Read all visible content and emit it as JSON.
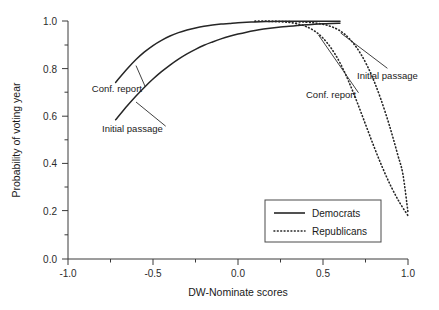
{
  "chart_data": {
    "type": "line",
    "title": "",
    "xlabel": "DW-Nominate scores",
    "ylabel": "Probability of voting year",
    "xlim": [
      -1.0,
      1.0
    ],
    "ylim": [
      0.0,
      1.0
    ],
    "grid": false,
    "xticks": [
      "-1.0",
      "-0.5",
      "0.0",
      "0.5",
      "1.0"
    ],
    "xtick_values": [
      -1.0,
      -0.5,
      0.0,
      0.5,
      1.0
    ],
    "xminor_values": [
      -0.75,
      -0.25,
      0.25,
      0.75
    ],
    "yticks": [
      "0.0",
      "0.2",
      "0.4",
      "0.6",
      "0.8",
      "1.0"
    ],
    "ytick_values": [
      0.0,
      0.2,
      0.4,
      0.6,
      0.8,
      1.0
    ],
    "yminor_values": [
      0.1,
      0.3,
      0.5,
      0.7,
      0.9
    ],
    "legend_position": "lower-right",
    "legend": [
      {
        "name": "Democrats",
        "style": "solid"
      },
      {
        "name": "Republicans",
        "style": "dotted"
      }
    ],
    "series": [
      {
        "name": "Democrats - Conf. report",
        "party": "Democrats",
        "style": "solid",
        "points": [
          [
            -0.72,
            0.742
          ],
          [
            -0.65,
            0.8
          ],
          [
            -0.6,
            0.838
          ],
          [
            -0.55,
            0.87
          ],
          [
            -0.5,
            0.897
          ],
          [
            -0.45,
            0.919
          ],
          [
            -0.4,
            0.937
          ],
          [
            -0.35,
            0.951
          ],
          [
            -0.3,
            0.962
          ],
          [
            -0.25,
            0.971
          ],
          [
            -0.2,
            0.978
          ],
          [
            -0.15,
            0.983
          ],
          [
            -0.1,
            0.987
          ],
          [
            -0.05,
            0.99
          ],
          [
            0.0,
            0.993
          ],
          [
            0.05,
            0.995
          ],
          [
            0.1,
            0.996
          ],
          [
            0.2,
            0.998
          ],
          [
            0.3,
            0.999
          ],
          [
            0.4,
            0.999
          ],
          [
            0.5,
            0.999
          ],
          [
            0.6,
            0.999
          ]
        ]
      },
      {
        "name": "Democrats - Initial passage",
        "party": "Democrats",
        "style": "solid",
        "points": [
          [
            -0.72,
            0.585
          ],
          [
            -0.65,
            0.645
          ],
          [
            -0.6,
            0.685
          ],
          [
            -0.55,
            0.722
          ],
          [
            -0.5,
            0.756
          ],
          [
            -0.45,
            0.787
          ],
          [
            -0.4,
            0.815
          ],
          [
            -0.35,
            0.84
          ],
          [
            -0.3,
            0.862
          ],
          [
            -0.25,
            0.881
          ],
          [
            -0.2,
            0.898
          ],
          [
            -0.15,
            0.912
          ],
          [
            -0.1,
            0.925
          ],
          [
            -0.05,
            0.936
          ],
          [
            0.0,
            0.945
          ],
          [
            0.05,
            0.953
          ],
          [
            0.1,
            0.96
          ],
          [
            0.15,
            0.966
          ],
          [
            0.2,
            0.971
          ],
          [
            0.25,
            0.975
          ],
          [
            0.3,
            0.978
          ],
          [
            0.35,
            0.981
          ],
          [
            0.4,
            0.984
          ],
          [
            0.45,
            0.986
          ],
          [
            0.5,
            0.988
          ],
          [
            0.55,
            0.99
          ],
          [
            0.6,
            0.991
          ]
        ]
      },
      {
        "name": "Republicans - Conf. report",
        "party": "Republicans",
        "style": "dotted",
        "points": [
          [
            0.1,
            0.999
          ],
          [
            0.15,
            0.999
          ],
          [
            0.2,
            0.998
          ],
          [
            0.25,
            0.997
          ],
          [
            0.3,
            0.994
          ],
          [
            0.35,
            0.988
          ],
          [
            0.4,
            0.977
          ],
          [
            0.45,
            0.958
          ],
          [
            0.5,
            0.928
          ],
          [
            0.55,
            0.884
          ],
          [
            0.6,
            0.824
          ],
          [
            0.65,
            0.748
          ],
          [
            0.7,
            0.66
          ],
          [
            0.75,
            0.566
          ],
          [
            0.8,
            0.472
          ],
          [
            0.85,
            0.384
          ],
          [
            0.9,
            0.305
          ],
          [
            0.95,
            0.238
          ],
          [
            1.0,
            0.182
          ]
        ]
      },
      {
        "name": "Republicans - Initial passage",
        "party": "Republicans",
        "style": "dotted",
        "points": [
          [
            0.1,
            0.999
          ],
          [
            0.18,
            0.999
          ],
          [
            0.25,
            0.998
          ],
          [
            0.32,
            0.997
          ],
          [
            0.4,
            0.995
          ],
          [
            0.46,
            0.991
          ],
          [
            0.52,
            0.983
          ],
          [
            0.58,
            0.967
          ],
          [
            0.63,
            0.943
          ],
          [
            0.68,
            0.905
          ],
          [
            0.72,
            0.864
          ],
          [
            0.76,
            0.812
          ],
          [
            0.8,
            0.748
          ],
          [
            0.84,
            0.672
          ],
          [
            0.88,
            0.586
          ],
          [
            0.91,
            0.514
          ],
          [
            0.94,
            0.437
          ],
          [
            0.97,
            0.356
          ],
          [
            1.0,
            0.196
          ]
        ]
      }
    ],
    "annotations": [
      {
        "text": "Conf. report",
        "x": -0.86,
        "y": 0.7,
        "side": "left",
        "target_series": "Democrats - Conf. report"
      },
      {
        "text": "Initial passage",
        "x": -0.8,
        "y": 0.535,
        "side": "left",
        "target_series": "Democrats - Initial passage"
      },
      {
        "text": "Conf. report",
        "x": 0.4,
        "y": 0.675,
        "side": "right",
        "target_series": "Republicans - Conf. report"
      },
      {
        "text": "Initial passage",
        "x": 0.7,
        "y": 0.755,
        "side": "right",
        "target_series": "Republicans - Initial passage"
      }
    ]
  }
}
